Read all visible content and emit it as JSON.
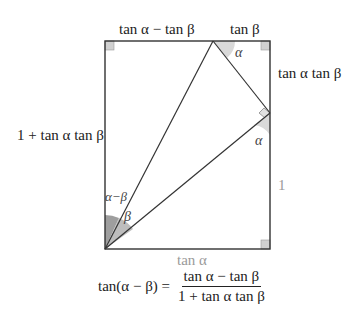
{
  "diagram": {
    "labels": {
      "top_left_segment": "tan α − tan β",
      "top_right_segment": "tan β",
      "right_upper_segment": "tan α tan β",
      "right_lower_segment": "1",
      "left_side": "1 + tan α tan β",
      "bottom_side": "tan α"
    },
    "angles": {
      "top_vertex": "α",
      "right_vertex": "α",
      "bottom_left_outer": "α−β",
      "bottom_left_inner": "β"
    },
    "formula": {
      "lhs": "tan(α − β) =",
      "numerator": "tan α − tan β",
      "denominator": "1 + tan α tan β"
    },
    "colors": {
      "line": "#333333",
      "angle_fill": "#d9d9d9",
      "angle_fill_dark": "#9e9e9e",
      "gray_label": "#9a9a9a"
    }
  }
}
